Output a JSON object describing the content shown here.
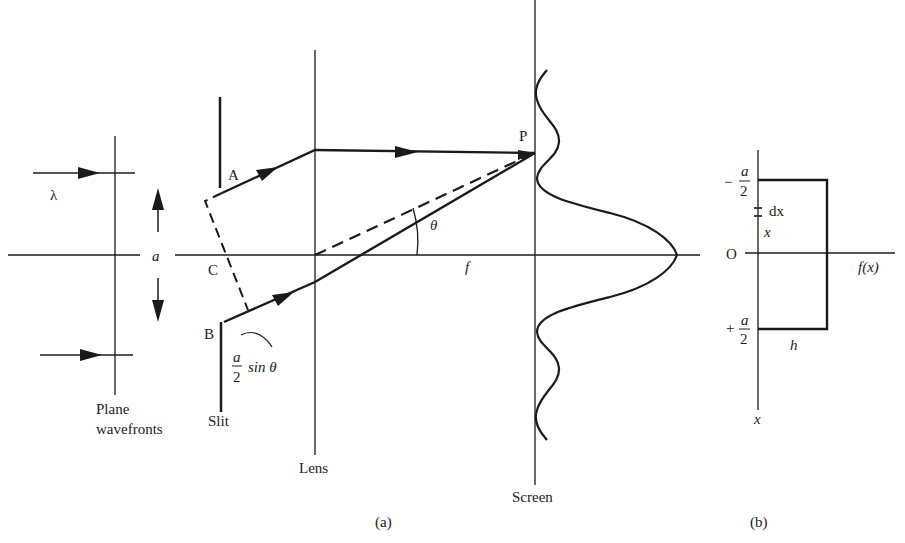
{
  "panel_a": {
    "caption": "(a)",
    "labels": {
      "lambda": "λ",
      "a": "a",
      "A": "A",
      "B": "B",
      "C": "C",
      "P": "P",
      "theta": "θ",
      "f": "f",
      "path_diff_num": "a",
      "path_diff_den": "2",
      "path_diff_rest": "sin θ",
      "plane_line1": "Plane",
      "plane_line2": "wavefronts",
      "slit": "Slit",
      "lens": "Lens",
      "screen": "Screen"
    }
  },
  "panel_b": {
    "caption": "(b)",
    "labels": {
      "minus": "−",
      "plus": "+",
      "frac_num_top": "a",
      "frac_den_top": "2",
      "frac_num_bot": "a",
      "frac_den_bot": "2",
      "dx": "dx",
      "x_inner": "x",
      "origin": "O",
      "fx": "f(x)",
      "h": "h",
      "x_axis": "x"
    }
  },
  "colors": {
    "ink": "#1a1a1a",
    "background": "#ffffff"
  }
}
